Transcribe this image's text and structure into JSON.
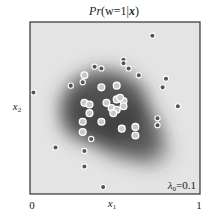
{
  "chart_data": {
    "type": "scatter",
    "title": "Pr(w=1|x)",
    "title_parts": {
      "pre": "Pr",
      "arg": "(w=1|",
      "bold": "x",
      "post": ")"
    },
    "xlabel": "x",
    "xlabel_sub": "1",
    "ylabel": "x",
    "ylabel_sub": "2",
    "xlim": [
      0,
      1
    ],
    "ylim": [
      0,
      1
    ],
    "x_ticks": [
      "0",
      "1"
    ],
    "annotation": "λ₀=0.1",
    "annotation_parts": {
      "pre": "λ",
      "sub": "0",
      "post": "=0.1"
    },
    "grid": false,
    "legend": "none",
    "background": "grayscale probability map; dark = high Pr(w=1|x)",
    "series": [
      {
        "name": "w=1",
        "marker": "light-gray disc with white ring",
        "color": "#c8c8c8",
        "points": [
          [
            0.32,
            0.69
          ],
          [
            0.42,
            0.62
          ],
          [
            0.51,
            0.63
          ],
          [
            0.32,
            0.53
          ],
          [
            0.35,
            0.52
          ],
          [
            0.45,
            0.53
          ],
          [
            0.51,
            0.55
          ],
          [
            0.55,
            0.54
          ],
          [
            0.48,
            0.5
          ],
          [
            0.51,
            0.49
          ],
          [
            0.55,
            0.51
          ],
          [
            0.35,
            0.47
          ],
          [
            0.31,
            0.42
          ],
          [
            0.42,
            0.42
          ],
          [
            0.31,
            0.36
          ],
          [
            0.54,
            0.38
          ],
          [
            0.62,
            0.39
          ],
          [
            0.62,
            0.34
          ],
          [
            0.49,
            0.47
          ],
          [
            0.53,
            0.56
          ]
        ]
      },
      {
        "name": "w=0",
        "marker": "dark-gray disc with white ring",
        "color": "#555555",
        "points": [
          [
            0.72,
            0.92
          ],
          [
            0.55,
            0.78
          ],
          [
            0.55,
            0.76
          ],
          [
            0.58,
            0.73
          ],
          [
            0.64,
            0.69
          ],
          [
            0.8,
            0.67
          ],
          [
            0.78,
            0.62
          ],
          [
            0.38,
            0.74
          ],
          [
            0.42,
            0.73
          ],
          [
            0.31,
            0.65
          ],
          [
            0.24,
            0.63
          ],
          [
            0.02,
            0.59
          ],
          [
            0.87,
            0.51
          ],
          [
            0.75,
            0.44
          ],
          [
            0.75,
            0.4
          ],
          [
            0.36,
            0.32
          ],
          [
            0.15,
            0.27
          ],
          [
            0.32,
            0.25
          ],
          [
            0.32,
            0.16
          ],
          [
            0.43,
            0.04
          ]
        ]
      }
    ],
    "probability_blobs": [
      {
        "cx": 0.44,
        "cy": 0.5,
        "rx": 0.26,
        "ry": 0.22,
        "strength": 0.85
      },
      {
        "cx": 0.58,
        "cy": 0.36,
        "rx": 0.2,
        "ry": 0.16,
        "strength": 0.7
      },
      {
        "cx": 0.7,
        "cy": 0.26,
        "rx": 0.12,
        "ry": 0.1,
        "strength": 0.45
      },
      {
        "cx": 0.3,
        "cy": 0.44,
        "rx": 0.12,
        "ry": 0.12,
        "strength": 0.5
      }
    ]
  }
}
